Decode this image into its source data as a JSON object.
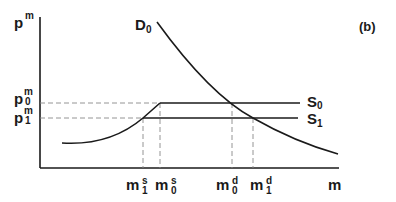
{
  "panel_label": "(b)",
  "axes": {
    "y_label": {
      "base": "p",
      "sup": "m"
    },
    "x_label": "m"
  },
  "price_levels": [
    {
      "base": "p",
      "sup": "m",
      "sub": "0"
    },
    {
      "base": "p",
      "sup": "m",
      "sub": "1"
    }
  ],
  "curves": {
    "demand": {
      "base": "D",
      "sub": "0"
    },
    "supply0": {
      "base": "S",
      "sub": "0"
    },
    "supply1": {
      "base": "S",
      "sub": "1"
    }
  },
  "quantity_marks": [
    {
      "base": "m",
      "sup": "s",
      "sub": "1"
    },
    {
      "base": "m",
      "sup": "s",
      "sub": "0"
    },
    {
      "base": "m",
      "sup": "d",
      "sub": "0"
    },
    {
      "base": "m",
      "sup": "d",
      "sub": "1"
    }
  ],
  "colors": {
    "line": "#1a1a1a",
    "dashed": "#888888"
  }
}
